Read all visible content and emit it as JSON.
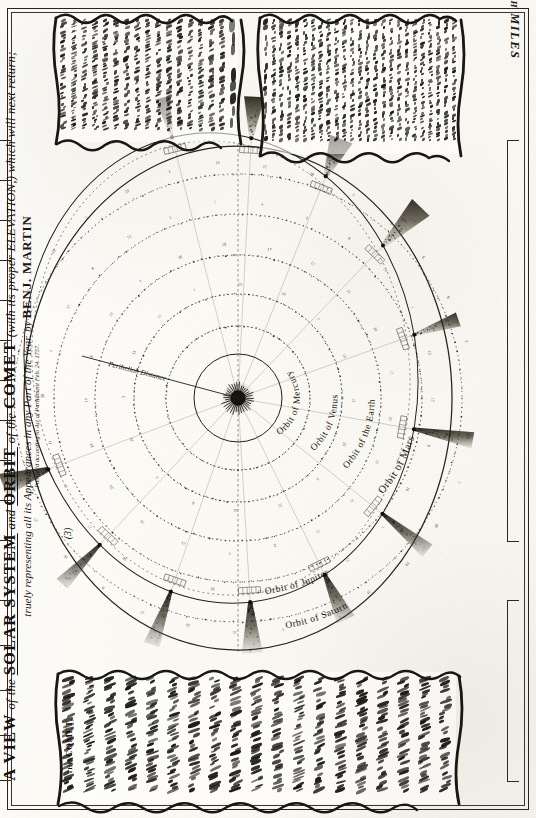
{
  "plate": {
    "title_main": "A VIEW of the SOLAR SYSTEM and ORBIT of the COMET",
    "title_part_a": "A VIEW",
    "title_of1": "of",
    "title_the1": "the",
    "title_solar_system": "SOLAR SYSTEM",
    "title_and": "and",
    "title_orbit": "ORBIT",
    "title_of2": "of",
    "title_the2": "the",
    "title_comet": "COMET",
    "title_paren": "(with its proper ELEVATION,) which will next return;",
    "title_line2": "truely representing all its Appearances in any Part of the Year.",
    "title_by": "by",
    "title_author": "BENJ. MARTIN",
    "title_imprint": "Publish'd according to Act of Parliament Feb. 24. 1757.",
    "plate_number": "(3)"
  },
  "scale": {
    "label": "MILLIONS of English MILES",
    "ticks": [
      "10",
      "20",
      "30",
      "40",
      "50",
      "60",
      "70",
      "80",
      "90",
      "100"
    ]
  },
  "orbits": [
    {
      "name": "orbit-mercury",
      "label": "Orbit of Mercury"
    },
    {
      "name": "orbit-venus",
      "label": "Orbit of Venus"
    },
    {
      "name": "orbit-earth",
      "label": "Orbit of the Earth"
    },
    {
      "name": "orbit-mars",
      "label": "Orbit of Mars"
    },
    {
      "name": "orbit-jupiter",
      "label": "Orbit of Jupiter"
    },
    {
      "name": "orbit-saturn",
      "label": "Orbit of Saturn"
    }
  ],
  "diagram": {
    "sun_label": "Sun",
    "perihelion_label": "Perihelion Distance",
    "comet_orbit_label": "Orbit of the Comet",
    "comet_count": 12
  },
  "cartouche_top_left": {
    "lines": [
      "And that we may know, at any time, the",
      "Place in which the Comet shall appear, in all Parts of the Sky,",
      "as it will be seen from the Earth, I have",
      "placed an equal Line above the Orbit, and therefore",
      "the different Motions of it may be observed in",
      "the Place of the Comet is observed in",
      "his Orbit. Mercury held every the",
      "from the Rising of the Numbers, where",
      "the degrees, are shewn to be in the Place",
      "the Place in the Ecliptic, which will",
      "answer from the Looking-Glass, shew a",
      "Quarter of the Compass, will shew",
      "the Place where the Comet is in, and for",
      "the Comet is at Perihelion, and it's nearest",
      "known from the Earth, at any equal",
      "Distance of the Earth away from",
      "the Year."
    ]
  },
  "cartouche_top_right": {
    "lines": [
      "In this Scheme the Sun",
      "Orbit is exactly shewn, where the Elliptic",
      "where the Elliptic and the Line",
      "in an even Angle of 17° 56'. In",
      "this Orbit its inclined to the Plane of",
      "the Ecliptic at an Angle of the top-most",
      "Part of the Orbit, wherein is the Section,",
      "and so the ascending and descending Nodes,",
      "perhaps that Orbit is always the Section",
      "is in the Center of the Sun, in which the",
      "Little Part on the lower or the left hand",
      "is in the Center of the Sun, as the Comet",
      "in its Descending, and Vice versa.",
      "Dr. HALLEY makes the Comet's Period",
      "in the Ascending and Vice versa.",
      "Dr. Remarks, the Motion of the Comet",
      "is to the Earth's own Period, many Times",
      "the Earth's own Annual Motion, as",
      "shewn by the Line at the top, so that",
      "the Combination, and should that happen in the",
      "Part of the Heavens. This is the Line which",
      "are obliged to be near longer, and so following",
      "the Elevation thereof will be rising.",
      "Sky, in what Part of the Heavens.",
      "upon the Earth, in all Parts of the Year."
    ]
  },
  "cartouche_bottom": {
    "head": "the COMET,",
    "lines": [
      "the COMET, of which we here treat,",
      "appeared in this Form, owing in the Year 1682,",
      "from the Lowest Part of the Heavens",
      "where its Orbit was observed to be",
      "in its Perihelion, as determined by",
      "the Rules of the Comet, and observ'd that",
      "whatever Part of the Heavens it",
      "moved in a Direction contrary to the",
      "Order of the Signs, and its Return",
      "was predicted by Dr. HALLEY to be in",
      "the Year 1758, and that the Comet",
      "will then again be seen in the Heavens,",
      "as it was determined, and shall",
      "return again in the Year 1758, and",
      "the Heliocentric Place of the Comet",
      "in its Orbit, descending all the",
      "Perihelion, shall be seen by it's",
      "Motion, according to the Elevation of",
      "this Scheme, in the Year 1758."
    ],
    "author_ref": "Dr. HALLEY",
    "year": "1758"
  },
  "colors": {
    "ink": "#17140f",
    "paper": "#fbfaf5",
    "border": "#262320"
  }
}
